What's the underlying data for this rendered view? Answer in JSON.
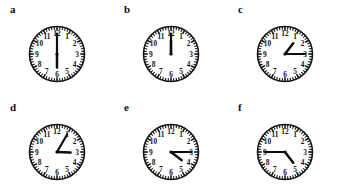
{
  "figure": {
    "kind": "analog-clock-reading-worksheet",
    "rows": 2,
    "columns": 3,
    "background_color": "#ffffff",
    "ink_color": "#141414"
  },
  "dial": {
    "hour_numbers": [
      "1",
      "2",
      "3",
      "4",
      "5",
      "6",
      "7",
      "8",
      "9",
      "10",
      "11",
      "12"
    ],
    "minute_tick_count": 60,
    "hour_tick_count": 12,
    "face_color": "#ffffff",
    "outline_color": "#141414",
    "hand_color": "#0d0d0d"
  },
  "clocks": [
    {
      "label": "a",
      "time": "6:00",
      "hour": 6,
      "minute": 0,
      "hour_angle_deg": 180,
      "minute_angle_deg": 0
    },
    {
      "label": "b",
      "time": "12:00",
      "hour": 12,
      "minute": 0,
      "hour_angle_deg": 0,
      "minute_angle_deg": 0
    },
    {
      "label": "c",
      "time": "1:15",
      "hour": 1,
      "minute": 15,
      "hour_angle_deg": 37.5,
      "minute_angle_deg": 90
    },
    {
      "label": "d",
      "time": "3:05",
      "hour": 3,
      "minute": 5,
      "hour_angle_deg": 92.5,
      "minute_angle_deg": 30
    },
    {
      "label": "e",
      "time": "4:15",
      "hour": 4,
      "minute": 15,
      "hour_angle_deg": 127.5,
      "minute_angle_deg": 90
    },
    {
      "label": "f",
      "time": "4:45",
      "hour": 4,
      "minute": 45,
      "hour_angle_deg": 142.5,
      "minute_angle_deg": 270
    }
  ]
}
